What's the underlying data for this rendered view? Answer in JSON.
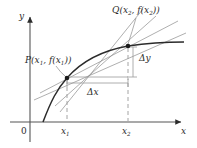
{
  "figure": {
    "kind": "calculus-secant-tangent-diagram",
    "background": "#ffffff",
    "ink": "#2b2b2b",
    "light_ink": "#7d7d7d",
    "width": 197,
    "height": 148
  },
  "axes": {
    "x_label": "x",
    "y_label": "y",
    "origin_label": "0",
    "x_axis_y": 122,
    "y_axis_x": 30,
    "x_arrow_tip": [
      184,
      122
    ],
    "y_arrow_tip": [
      30,
      14
    ]
  },
  "ticks": {
    "x1_label": "x",
    "x1_sub": "1",
    "x2_label": "x",
    "x2_sub": "2",
    "x1_pos": 67,
    "x2_pos": 128
  },
  "points": [
    {
      "name": "P",
      "label_main": "P(x",
      "label_sub1": "1",
      "label_mid": ", f(x",
      "label_sub2": "1",
      "label_end": "))",
      "x": 67,
      "y": 78
    },
    {
      "name": "Q",
      "label_main": "Q(x",
      "label_sub1": "2",
      "label_mid": ", f(x",
      "label_sub2": "2",
      "label_end": "))",
      "x": 128,
      "y": 46
    }
  ],
  "annotations": {
    "delta_x": "Δx",
    "delta_y": "Δy",
    "delta_x_pos": [
      92,
      88
    ],
    "delta_y_pos": [
      140,
      55
    ]
  },
  "curve": {
    "description": "increasing concave-down function",
    "path": "M 44,121 C 52,100 58,88 67,78 C 80,63 100,51 128,46 C 148,43 166,42 182,42"
  },
  "lines": {
    "tangent_at_P": "M 36,99 L 183,33",
    "secant_PQ": "M 45,88 L 168,24",
    "steep_line_1": "M 55,104 L 156,17",
    "steep_line_2": "M 60,110 L 144,10"
  }
}
